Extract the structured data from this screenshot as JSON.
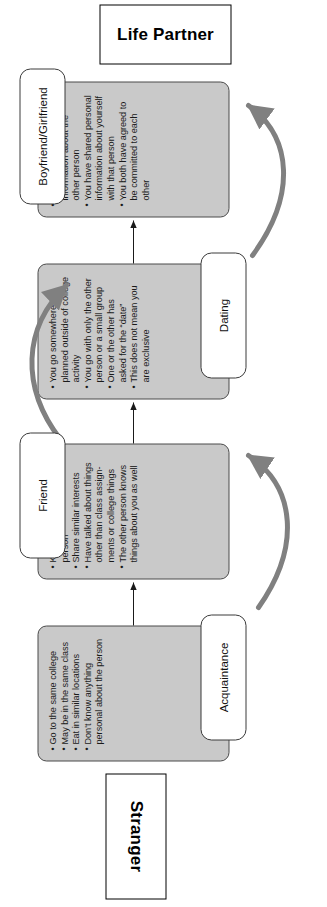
{
  "figure": {
    "start_label": "Stranger",
    "end_label": "Life Partner",
    "gray_fill": "#c9c9c9",
    "gray_stroke": "#4a4a4a",
    "curve_arrow_color": "#808080",
    "thin_arrow_color": "#1a1a1a"
  },
  "stages": [
    {
      "id": "acquaintance",
      "label": "Acquaintance",
      "label_side": "right",
      "bullets": [
        "Go to the same college",
        "May be in the same class",
        "Eat in similar locations",
        "Don't know anything personal about the person"
      ]
    },
    {
      "id": "friend",
      "label": "Friend",
      "label_side": "left",
      "bullets": [
        "Know details about the person",
        "Share similar interests",
        "Have talked about things other than class assign-ments or college things",
        "The other person knows things about you as well"
      ]
    },
    {
      "id": "dating",
      "label": "Dating",
      "label_side": "right",
      "bullets": [
        "You go somewhere planned outside of college activity",
        "You go with only the other person or a small group",
        "One or the other has asked for the “date”",
        "This does not mean you are exclusive"
      ]
    },
    {
      "id": "boyfriend-girlfriend",
      "label": "Boyfriend/Girlfriend",
      "label_side": "left",
      "bullets": [
        "You know personal information about the other person",
        "You have shared personal information about yourself with that person",
        "You both have agreed to be committed to each other"
      ]
    }
  ]
}
